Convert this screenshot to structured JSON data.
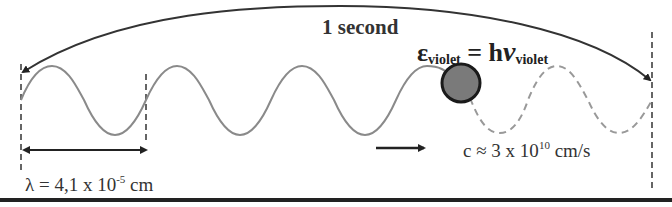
{
  "diagram": {
    "title": "1 second",
    "energy_equation": {
      "symbol": "ε",
      "symbol_subscript": "violet",
      "equals": "= h",
      "frequency_symbol": "ν",
      "frequency_subscript": "violet"
    },
    "wavelength_label": {
      "prefix": "λ = 4,1 x 10",
      "exponent": "-5",
      "unit": " cm"
    },
    "speed_label": {
      "prefix": "c ≈ 3 x 10",
      "exponent": "10",
      "unit": " cm/s"
    },
    "elements": {
      "solid_wave": "emitted wave (solid)",
      "dashed_wave": "future wave path (dashed)",
      "photon": "photon particle (grey ball)",
      "direction_arrow": "propagation direction",
      "time_arc": "one-second span arc"
    },
    "colors": {
      "wave": "#8a8a8a",
      "photon_fill": "#7a7a7a",
      "photon_stroke": "#1a1a1a",
      "ink": "#222222"
    }
  }
}
